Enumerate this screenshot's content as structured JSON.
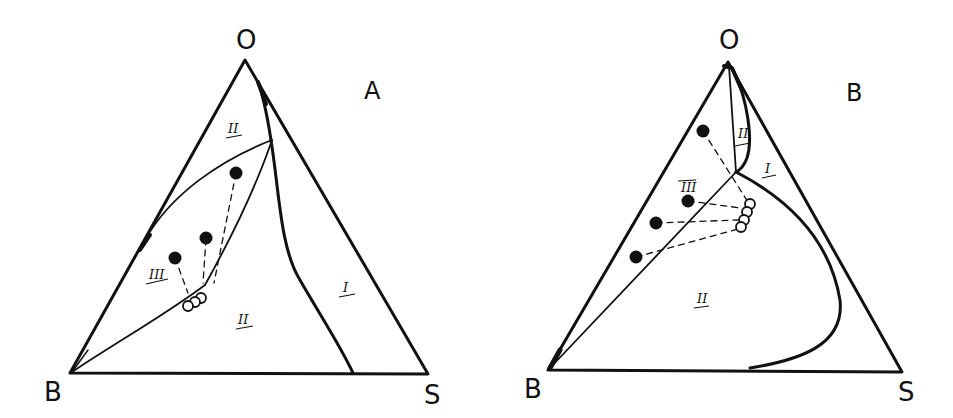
{
  "figure": {
    "panels": [
      {
        "id": "A",
        "panel_label": "A",
        "vertices": {
          "top": "O",
          "bottom_left": "B",
          "bottom_right": "S"
        },
        "regions": [
          "II",
          "III",
          "II",
          "I"
        ],
        "filled_points": 3,
        "open_points": 3
      },
      {
        "id": "B",
        "panel_label": "B",
        "vertices": {
          "top": "O",
          "bottom_left": "B",
          "bottom_right": "S"
        },
        "regions": [
          "II",
          "I",
          "III",
          "II"
        ],
        "filled_points": 4,
        "open_points": 4
      }
    ],
    "colors": {
      "ink": "#111111",
      "background": "#ffffff"
    }
  }
}
